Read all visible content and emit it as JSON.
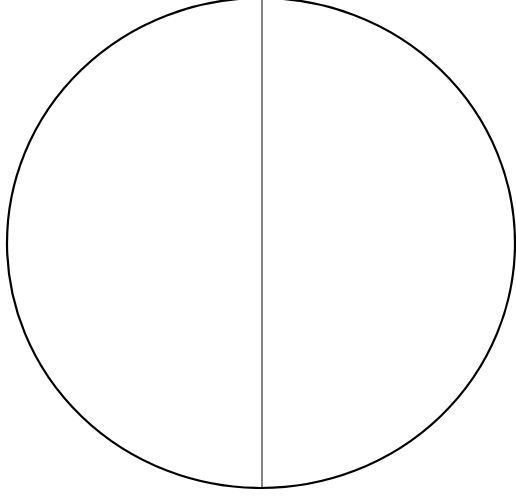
{
  "diagram": {
    "type": "circle-divided-by-vertical-line",
    "circle": {
      "cx": 261,
      "cy": 243,
      "rx": 254,
      "ry": 245,
      "stroke": "#000000",
      "stroke_width": 2.2,
      "fill": "#ffffff"
    },
    "divider": {
      "x": 262,
      "y1": 0,
      "y2": 487,
      "stroke": "#333333",
      "stroke_width": 1.2
    },
    "labels": []
  }
}
